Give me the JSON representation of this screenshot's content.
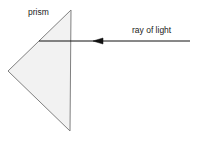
{
  "figure": {
    "background_color": "#ffffff",
    "labels": {
      "prism": "prism",
      "ray": "ray of light"
    },
    "prism": {
      "name": "triangular prism",
      "fill_color": "#f2f2f2",
      "stroke_color": "#808080",
      "stroke_width": 1,
      "vertices": [
        {
          "x": 71,
          "y": 10
        },
        {
          "x": 70,
          "y": 131
        },
        {
          "x": 8,
          "y": 71
        }
      ]
    },
    "ray": {
      "name": "incident light ray",
      "color": "#111111",
      "stroke_width": 1,
      "direction": "leftward",
      "start": {
        "x": 190,
        "y": 41
      },
      "end": {
        "x": 39,
        "y": 41
      },
      "arrowhead": {
        "tip": {
          "x": 93,
          "y": 41
        },
        "back": {
          "x": 103,
          "y": 41
        },
        "half_width": 3
      }
    }
  }
}
